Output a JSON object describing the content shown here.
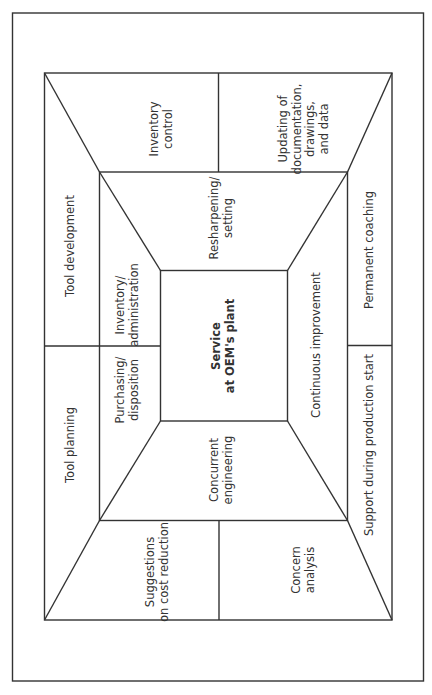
{
  "diagram": {
    "type": "nested-frame-diagram",
    "orientation": "rotated-90-ccw",
    "colors": {
      "line": "#333333",
      "background": "#ffffff",
      "text": "#333333"
    },
    "center": {
      "label": "Service\nat OEM's plant"
    },
    "middle_ring": {
      "top": "Resharpening/\nsetting",
      "left_upper": "Inventory/\nadministration",
      "left_lower": "Purchasing/\ndisposition",
      "right": "Continuous improvement",
      "bottom": "Concurrent\nengineering"
    },
    "outer_ring": {
      "top_left": "Inventory\ncontrol",
      "top_right": "Updating of\ndocumentation,\ndrawings,\nand data",
      "left_upper": "Tool development",
      "left_lower": "Tool planning",
      "right_upper": "Permanent coaching",
      "right_lower": "Support during production start",
      "bottom_left": "Suggestions\non cost reduction",
      "bottom_right": "Concern\nanalysis"
    }
  }
}
